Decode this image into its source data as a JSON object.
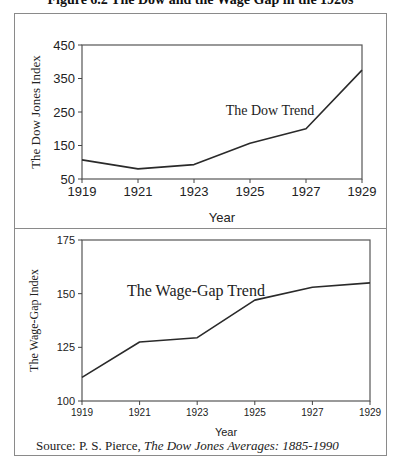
{
  "figure": {
    "title": "Figure 6.2 The Dow and the Wage Gap in the 1920s",
    "source_prefix": "Source: P. S. Pierce, ",
    "source_title": "The Dow Jones Averages: 1885-1990"
  },
  "chart_data": [
    {
      "type": "line",
      "title": "",
      "annotation": "The Dow Trend",
      "xlabel": "Year",
      "ylabel": "The Dow Jones Index",
      "x": [
        1919,
        1921,
        1923,
        1925,
        1927,
        1929
      ],
      "x_ticks": [
        "1919",
        "1921",
        "1923",
        "1925",
        "1927",
        "1929"
      ],
      "y_ticks": [
        "50",
        "150",
        "250",
        "350",
        "450"
      ],
      "ylim": [
        50,
        450
      ],
      "grid": false,
      "legend": "none",
      "series": [
        {
          "name": "The Dow Trend",
          "values": [
            107,
            80,
            93,
            157,
            200,
            375
          ]
        }
      ]
    },
    {
      "type": "line",
      "title": "",
      "annotation": "The Wage-Gap Trend",
      "xlabel": "Year",
      "ylabel": "The Wage-Gap Index",
      "x": [
        1919,
        1921,
        1923,
        1925,
        1927,
        1929
      ],
      "x_ticks": [
        "1919",
        "1921",
        "1923",
        "1925",
        "1927",
        "1929"
      ],
      "y_ticks": [
        "100",
        "125",
        "150",
        "175"
      ],
      "ylim": [
        100,
        175
      ],
      "grid": false,
      "legend": "none",
      "series": [
        {
          "name": "The Wage-Gap Trend",
          "values": [
            111,
            127.5,
            129.5,
            147,
            153,
            155
          ]
        }
      ]
    }
  ]
}
